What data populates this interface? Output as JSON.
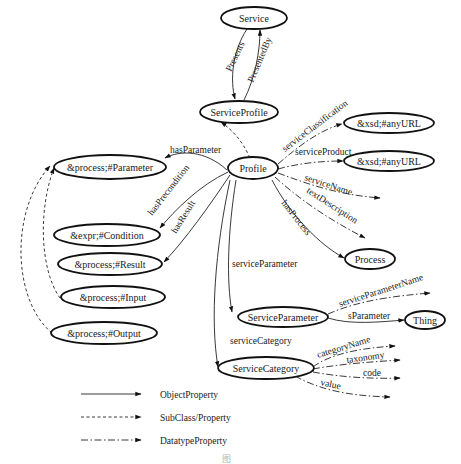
{
  "diagram": {
    "nodes": {
      "service": "Service",
      "service_profile": "ServiceProfile",
      "profile": "Profile",
      "process_parameter": "&process;#Parameter",
      "expr_condition": "&expr;#Condition",
      "process_result": "&process;#Result",
      "process_input": "&process;#Input",
      "process_output": "&process;#Output",
      "xsd_anyuri_1": "&xsd;#anyURL",
      "xsd_anyuri_2": "&xsd;#anyURL",
      "process": "Process",
      "service_parameter": "ServiceParameter",
      "thing": "Thing",
      "service_category": "ServiceCategory"
    },
    "edges": {
      "presents": "Presents",
      "presented_by": "PresentedBy",
      "has_parameter": "hasParameter",
      "has_precondition": "hasPrecondition",
      "has_result": "hasResult",
      "service_classification": "serviceClassification",
      "service_product": "serviceProduct",
      "service_name": "serviceName",
      "text_description": "textDescription",
      "has_process": "hasProcess",
      "service_parameter": "serviceParameter",
      "service_parameter_name": "serviceParameterName",
      "s_parameter": "sParameter",
      "service_category": "serviceCategory",
      "category_name": "categoryName",
      "taxonomy": "taxonomy",
      "code": "code",
      "value": "value"
    },
    "legend": [
      {
        "style": "solid",
        "label": "ObjectProperty"
      },
      {
        "style": "dashed",
        "label": "SubClass/Property"
      },
      {
        "style": "dash-dot",
        "label": "DatatypeProperty"
      }
    ],
    "caption": "图"
  }
}
